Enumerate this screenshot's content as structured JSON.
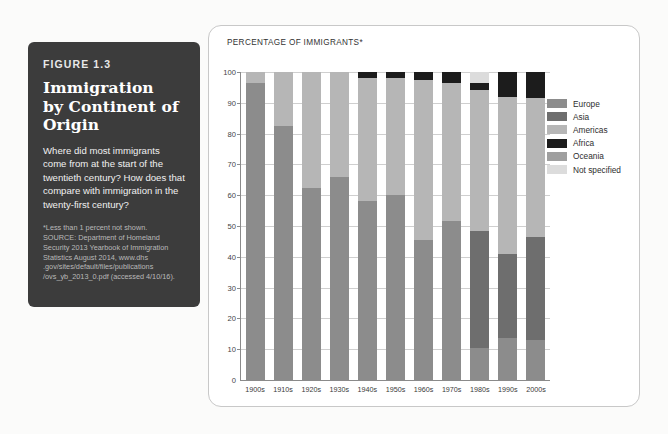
{
  "figure": {
    "number": "FIGURE 1.3",
    "title_lines": [
      "Immigration",
      "by Continent of",
      "Origin"
    ],
    "description": "Where did most immigrants come from at the start of the twentieth century? How does that compare with immigration in the twenty-first century?",
    "source_lines": [
      "*Less than 1 percent not shown.",
      "SOURCE: Department of Homeland",
      "Security 2013 Yearbook of Immigration",
      "Statistics August 2014, www.dhs",
      ".gov/sites/default/files/publications",
      "/ovs_yb_2013_0.pdf (accessed 4/10/16)."
    ]
  },
  "colors": {
    "card_background": "#3c3c3c",
    "page_background": "#fbfbfa",
    "chart_card_background": "#ffffff",
    "chart_card_border": "#c8c8c8",
    "axis": "#8a8a8a",
    "gridline": "#cfcfcf",
    "europe": "#8c8c8c",
    "asia": "#6e6e6e",
    "americas": "#b6b6b6",
    "africa": "#1c1c1c",
    "oceania": "#9f9f9f",
    "not_specified": "#dcdcdc"
  },
  "chart_data": {
    "type": "bar",
    "subtype": "stacked-bar-100",
    "ylabel": "PERCENTAGE OF IMMIGRANTS*",
    "xlabel": "",
    "ylim": [
      0,
      100
    ],
    "yticks": [
      10,
      20,
      30,
      40,
      50,
      60,
      70,
      80,
      90,
      100
    ],
    "ytick_labels": [
      "10",
      "20",
      "30",
      "40",
      "50",
      "60",
      "70",
      "80",
      "90",
      "100"
    ],
    "zero_label": "0",
    "grid": true,
    "legend_position": "right",
    "categories": [
      "1900s",
      "1910s",
      "1920s",
      "1930s",
      "1940s",
      "1950s",
      "1960s",
      "1970s",
      "1980s",
      "1990s",
      "2000s"
    ],
    "series": [
      {
        "name": "Europe",
        "color": "#8c8c8c",
        "values": [
          96.5,
          82.5,
          62.5,
          66.0,
          58.0,
          60.0,
          45.5,
          51.5,
          10.5,
          13.5,
          13.0
        ]
      },
      {
        "name": "Asia",
        "color": "#6e6e6e",
        "values": [
          0,
          0,
          0,
          0,
          0,
          0,
          0,
          0,
          38.0,
          27.5,
          33.5
        ]
      },
      {
        "name": "Americas",
        "color": "#b6b6b6",
        "values": [
          3.5,
          17.5,
          37.5,
          34.0,
          40.0,
          38.0,
          52.0,
          45.0,
          45.5,
          51.0,
          45.0
        ]
      },
      {
        "name": "Africa",
        "color": "#1c1c1c",
        "values": [
          0,
          0,
          0,
          0,
          2.0,
          2.0,
          2.5,
          3.5,
          2.5,
          8.0,
          8.5
        ]
      },
      {
        "name": "Oceania",
        "color": "#9f9f9f",
        "values": [
          0,
          0,
          0,
          0,
          0,
          0,
          0,
          0,
          0,
          0,
          0
        ]
      },
      {
        "name": "Not specified",
        "color": "#dcdcdc",
        "values": [
          0,
          0,
          0,
          0,
          0,
          0,
          0,
          0,
          3.5,
          0,
          0
        ]
      }
    ]
  },
  "legend": {
    "items": [
      {
        "label": "Europe",
        "color": "#8c8c8c"
      },
      {
        "label": "Asia",
        "color": "#6e6e6e"
      },
      {
        "label": "Americas",
        "color": "#b6b6b6"
      },
      {
        "label": "Africa",
        "color": "#1c1c1c"
      },
      {
        "label": "Oceania",
        "color": "#9f9f9f"
      },
      {
        "label": "Not specified",
        "color": "#dcdcdc"
      }
    ]
  }
}
